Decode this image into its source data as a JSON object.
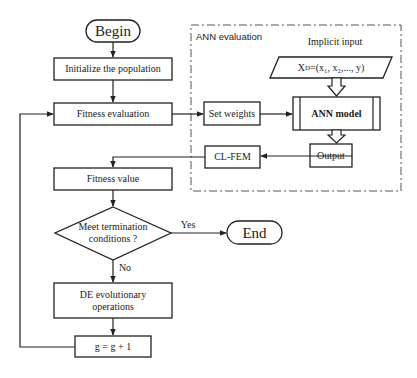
{
  "diagram": {
    "nodes": {
      "begin": {
        "label": "Begin",
        "shape": "terminal"
      },
      "init": {
        "label": "Initialize the population",
        "shape": "process"
      },
      "fitness_eval": {
        "label": "Fitness evaluation",
        "shape": "process"
      },
      "set_weights": {
        "label": "Set weights",
        "shape": "process"
      },
      "implicit_input_title": {
        "label": "Implicit input"
      },
      "input_data": {
        "label_main": "X",
        "label_sub": "D",
        "label_rest": "=(x₁, x₂,..., y)",
        "shape": "parallelogram"
      },
      "ann_model": {
        "label": "ANN model",
        "shape": "predefined-process"
      },
      "output": {
        "label": "Output",
        "shape": "process"
      },
      "clfem": {
        "label": "CL-FEM",
        "shape": "process"
      },
      "fitness_value": {
        "label": "Fitness value",
        "shape": "process"
      },
      "decision": {
        "line1": "Meet termination",
        "line2": "conditions ?",
        "shape": "decision"
      },
      "end": {
        "label": "End",
        "shape": "terminal"
      },
      "de_ops": {
        "line1": "DE evolutionary",
        "line2": "operations",
        "shape": "process"
      },
      "increment": {
        "label": "g = g + 1",
        "shape": "process"
      }
    },
    "group": {
      "label": "ANN evaluation",
      "style": "dash-dot"
    },
    "edge_labels": {
      "yes": "Yes",
      "no": "No"
    },
    "colors": {
      "stroke": "#222222",
      "background": "#ffffff",
      "group_border": "#555555"
    }
  }
}
